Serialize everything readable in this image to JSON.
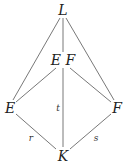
{
  "diagram": {
    "type": "lattice",
    "nodes": [
      {
        "id": "L",
        "label": "L",
        "x": 63,
        "y": 10
      },
      {
        "id": "EF",
        "label": "E F",
        "x": 63,
        "y": 60
      },
      {
        "id": "E",
        "label": "E",
        "x": 10,
        "y": 108
      },
      {
        "id": "F",
        "label": "F",
        "x": 117,
        "y": 108
      },
      {
        "id": "K",
        "label": "K",
        "x": 63,
        "y": 155
      }
    ],
    "edges": [
      {
        "from": "L",
        "to": "EF",
        "label": ""
      },
      {
        "from": "L",
        "to": "E",
        "label": ""
      },
      {
        "from": "L",
        "to": "F",
        "label": ""
      },
      {
        "from": "EF",
        "to": "E",
        "label": ""
      },
      {
        "from": "EF",
        "to": "F",
        "label": ""
      },
      {
        "from": "EF",
        "to": "K",
        "label": "t"
      },
      {
        "from": "E",
        "to": "K",
        "label": "r"
      },
      {
        "from": "F",
        "to": "K",
        "label": "s"
      }
    ],
    "edge_labels": {
      "t": "t",
      "r": "r",
      "s": "s"
    },
    "line_color": "#555555"
  }
}
